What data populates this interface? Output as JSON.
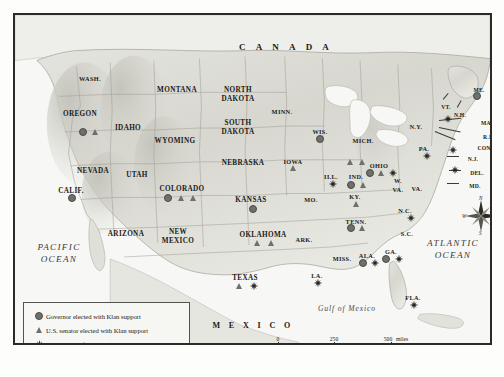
{
  "map": {
    "title_labels": {
      "canada": "C A N A D A",
      "mexico": "M E X I C O",
      "pacific_line1": "PACIFIC",
      "pacific_line2": "OCEAN",
      "atlantic_line1": "ATLANTIC",
      "atlantic_line2": "OCEAN",
      "gulf": "Gulf of Mexico"
    },
    "compass": {
      "n": "N",
      "e": "E",
      "s": "S",
      "w": "W"
    },
    "states": [
      {
        "name": "WASH.",
        "x": 75,
        "y": 60,
        "size": "sm"
      },
      {
        "name": "OREGON",
        "x": 65,
        "y": 95,
        "size": ""
      },
      {
        "name": "IDAHO",
        "x": 113,
        "y": 109,
        "size": ""
      },
      {
        "name": "MONTANA",
        "x": 162,
        "y": 71,
        "size": ""
      },
      {
        "name": "WYOMING",
        "x": 160,
        "y": 122,
        "size": ""
      },
      {
        "name": "NEVADA",
        "x": 78,
        "y": 152,
        "size": ""
      },
      {
        "name": "UTAH",
        "x": 122,
        "y": 156,
        "size": ""
      },
      {
        "name": "CALIF.",
        "x": 56,
        "y": 172,
        "size": ""
      },
      {
        "name": "ARIZONA",
        "x": 111,
        "y": 215,
        "size": ""
      },
      {
        "name": "NEW",
        "x": 163,
        "y": 213,
        "size": ""
      },
      {
        "name": "MEXICO",
        "x": 163,
        "y": 222,
        "size": ""
      },
      {
        "name": "COLORADO",
        "x": 167,
        "y": 170,
        "size": ""
      },
      {
        "name": "NORTH",
        "x": 223,
        "y": 71,
        "size": ""
      },
      {
        "name": "DAKOTA",
        "x": 223,
        "y": 80,
        "size": ""
      },
      {
        "name": "SOUTH",
        "x": 223,
        "y": 104,
        "size": ""
      },
      {
        "name": "DAKOTA",
        "x": 223,
        "y": 113,
        "size": ""
      },
      {
        "name": "NEBRASKA",
        "x": 228,
        "y": 144,
        "size": ""
      },
      {
        "name": "KANSAS",
        "x": 236,
        "y": 181,
        "size": ""
      },
      {
        "name": "OKLAHOMA",
        "x": 248,
        "y": 216,
        "size": ""
      },
      {
        "name": "TEXAS",
        "x": 230,
        "y": 259,
        "size": ""
      },
      {
        "name": "MINN.",
        "x": 267,
        "y": 93,
        "size": "sm"
      },
      {
        "name": "IOWA",
        "x": 278,
        "y": 143,
        "size": "sm"
      },
      {
        "name": "MO.",
        "x": 296,
        "y": 181,
        "size": "sm"
      },
      {
        "name": "ARK.",
        "x": 289,
        "y": 221,
        "size": "sm"
      },
      {
        "name": "LA.",
        "x": 302,
        "y": 257,
        "size": "sm"
      },
      {
        "name": "WIS.",
        "x": 305,
        "y": 113,
        "size": "sm"
      },
      {
        "name": "ILL.",
        "x": 316,
        "y": 158,
        "size": "sm"
      },
      {
        "name": "MICH.",
        "x": 348,
        "y": 122,
        "size": "sm"
      },
      {
        "name": "IND.",
        "x": 341,
        "y": 158,
        "size": "sm"
      },
      {
        "name": "OHIO",
        "x": 364,
        "y": 147,
        "size": "sm"
      },
      {
        "name": "KY.",
        "x": 340,
        "y": 178,
        "size": "sm"
      },
      {
        "name": "TENN.",
        "x": 341,
        "y": 203,
        "size": "sm"
      },
      {
        "name": "MISS.",
        "x": 327,
        "y": 240,
        "size": "sm"
      },
      {
        "name": "ALA.",
        "x": 352,
        "y": 237,
        "size": "sm"
      },
      {
        "name": "GA.",
        "x": 376,
        "y": 233,
        "size": "sm"
      },
      {
        "name": "FLA.",
        "x": 398,
        "y": 279,
        "size": "sm"
      },
      {
        "name": "S.C.",
        "x": 392,
        "y": 215,
        "size": "sm"
      },
      {
        "name": "N.C.",
        "x": 390,
        "y": 192,
        "size": "sm"
      },
      {
        "name": "W.",
        "x": 383,
        "y": 162,
        "size": "sm"
      },
      {
        "name": "VA.",
        "x": 383,
        "y": 171,
        "size": "sm"
      },
      {
        "name": "VA.",
        "x": 402,
        "y": 170,
        "size": "sm"
      },
      {
        "name": "PA.",
        "x": 409,
        "y": 130,
        "size": "sm"
      },
      {
        "name": "N.Y.",
        "x": 401,
        "y": 108,
        "size": "sm"
      },
      {
        "name": "VT.",
        "x": 431,
        "y": 88,
        "size": "xs"
      },
      {
        "name": "N.H.",
        "x": 445,
        "y": 96,
        "size": "xs"
      },
      {
        "name": "ME.",
        "x": 464,
        "y": 71,
        "size": "xs"
      },
      {
        "name": "MASS.",
        "x": 475,
        "y": 104,
        "size": "xs"
      },
      {
        "name": "R.I.",
        "x": 473,
        "y": 118,
        "size": "xs"
      },
      {
        "name": "CONN.",
        "x": 472,
        "y": 129,
        "size": "xs"
      },
      {
        "name": "N.J.",
        "x": 458,
        "y": 140,
        "size": "xs"
      },
      {
        "name": "DEL.",
        "x": 462,
        "y": 154,
        "size": "xs"
      },
      {
        "name": "MD.",
        "x": 460,
        "y": 167,
        "size": "xs"
      }
    ],
    "markers": [
      {
        "type": "circle",
        "x": 68,
        "y": 117,
        "state": "OREGON"
      },
      {
        "type": "triangle",
        "x": 80,
        "y": 117,
        "state": "OREGON"
      },
      {
        "type": "circle",
        "x": 57,
        "y": 183,
        "state": "CALIF."
      },
      {
        "type": "circle",
        "x": 153,
        "y": 183,
        "state": "COLORADO"
      },
      {
        "type": "triangle",
        "x": 166,
        "y": 183,
        "state": "COLORADO"
      },
      {
        "type": "triangle",
        "x": 178,
        "y": 183,
        "state": "COLORADO"
      },
      {
        "type": "circle",
        "x": 238,
        "y": 194,
        "state": "KANSAS"
      },
      {
        "type": "triangle",
        "x": 278,
        "y": 153,
        "state": "IOWA"
      },
      {
        "type": "triangle",
        "x": 242,
        "y": 228,
        "state": "OKLAHOMA"
      },
      {
        "type": "triangle",
        "x": 256,
        "y": 228,
        "state": "OKLAHOMA"
      },
      {
        "type": "triangle",
        "x": 224,
        "y": 271,
        "state": "TEXAS"
      },
      {
        "type": "star",
        "x": 239,
        "y": 271,
        "state": "TEXAS"
      },
      {
        "type": "star",
        "x": 303,
        "y": 268,
        "state": "LA."
      },
      {
        "type": "circle",
        "x": 305,
        "y": 124,
        "state": "WIS."
      },
      {
        "type": "star",
        "x": 318,
        "y": 169,
        "state": "ILL."
      },
      {
        "type": "triangle",
        "x": 335,
        "y": 147,
        "state": "IND."
      },
      {
        "type": "triangle",
        "x": 347,
        "y": 147,
        "state": "IND."
      },
      {
        "type": "circle",
        "x": 336,
        "y": 170,
        "state": "IND."
      },
      {
        "type": "triangle",
        "x": 348,
        "y": 170,
        "state": "IND."
      },
      {
        "type": "circle",
        "x": 355,
        "y": 158,
        "state": "OHIO"
      },
      {
        "type": "triangle",
        "x": 366,
        "y": 158,
        "state": "OHIO"
      },
      {
        "type": "star",
        "x": 378,
        "y": 158,
        "state": "OHIO"
      },
      {
        "type": "triangle",
        "x": 341,
        "y": 189,
        "state": "KY."
      },
      {
        "type": "circle",
        "x": 336,
        "y": 213,
        "state": "TENN."
      },
      {
        "type": "triangle",
        "x": 347,
        "y": 213,
        "state": "TENN."
      },
      {
        "type": "circle",
        "x": 348,
        "y": 248,
        "state": "ALA."
      },
      {
        "type": "star",
        "x": 360,
        "y": 248,
        "state": "ALA."
      },
      {
        "type": "circle",
        "x": 371,
        "y": 244,
        "state": "GA."
      },
      {
        "type": "star",
        "x": 384,
        "y": 244,
        "state": "GA."
      },
      {
        "type": "star",
        "x": 399,
        "y": 290,
        "state": "FLA."
      },
      {
        "type": "star",
        "x": 396,
        "y": 203,
        "state": "N.C."
      },
      {
        "type": "star",
        "x": 412,
        "y": 141,
        "state": "PA."
      },
      {
        "type": "star",
        "x": 433,
        "y": 104,
        "state": "N.Y."
      },
      {
        "type": "star",
        "x": 438,
        "y": 135,
        "state": "N.J."
      },
      {
        "type": "star",
        "x": 440,
        "y": 155,
        "state": "DEL."
      },
      {
        "type": "circle",
        "x": 462,
        "y": 81,
        "state": "ME."
      }
    ],
    "legend": {
      "items": [
        {
          "symbol": "circle",
          "label": "Governor elected with Klan support"
        },
        {
          "symbol": "triangle",
          "label": "U.S. senator elected with Klan support"
        },
        {
          "symbol": "star",
          "label": "Major areas of Klan violence"
        }
      ]
    },
    "scale": {
      "miles": {
        "ticks": [
          "0",
          "250",
          "500"
        ],
        "unit": "miles"
      },
      "kilometers": {
        "ticks": [
          "0",
          "250",
          "500"
        ],
        "unit": "kilometers"
      }
    },
    "colors": {
      "frame": "#2b2a26",
      "land": "#dcdcd6",
      "water": "#f7f7f5",
      "marker": "#6f6f6c",
      "star": "#262522",
      "text": "#1b1a17"
    }
  }
}
